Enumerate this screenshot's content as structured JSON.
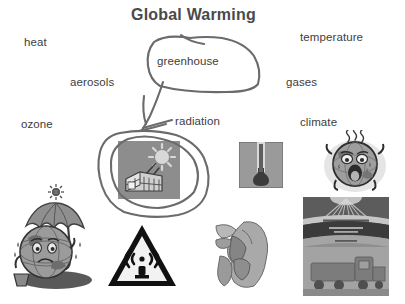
{
  "page": {
    "title": "Global Warming",
    "title_pos": {
      "x": 131,
      "y": 6
    },
    "background_color": "#ffffff",
    "ink_color": "#6b6b6b",
    "text_color": "#3d3d3d"
  },
  "word_labels": [
    {
      "id": "heat",
      "text": "heat",
      "x": 24,
      "y": 36
    },
    {
      "id": "temperature",
      "text": "temperature",
      "x": 300,
      "y": 31
    },
    {
      "id": "aerosols",
      "text": "aerosols",
      "x": 70,
      "y": 76
    },
    {
      "id": "gases",
      "text": "gases",
      "x": 286,
      "y": 76
    },
    {
      "id": "greenhouse",
      "text": "greenhouse",
      "x": 157,
      "y": 55,
      "circled": true
    },
    {
      "id": "ozone",
      "text": "ozone",
      "x": 21,
      "y": 118
    },
    {
      "id": "radiation",
      "text": "radiation",
      "x": 175,
      "y": 115
    },
    {
      "id": "climate",
      "text": "climate",
      "x": 300,
      "y": 116
    }
  ],
  "annotations": [
    {
      "id": "greenhouse-circle",
      "type": "hand-drawn-oval",
      "target": "greenhouse",
      "stroke": "#6b6b6b"
    },
    {
      "id": "greenhouse-to-image-arrow",
      "type": "hand-drawn-arrow",
      "from": "greenhouse-word",
      "to": "greenhouse-picture",
      "stroke": "#6b6b6b"
    },
    {
      "id": "greenhouse-picture-circle",
      "type": "hand-drawn-oval",
      "target": "greenhouse-picture",
      "stroke": "#6b6b6b"
    }
  ],
  "pictures": [
    {
      "id": "greenhouse-picture",
      "name": "greenhouse-sun-illustration",
      "caption": "greenhouse with sun and radiation rays",
      "x": 118,
      "y": 141,
      "w": 62,
      "h": 58,
      "fill": "#8d8d8d"
    },
    {
      "id": "earth-umbrella-picture",
      "name": "earth-with-umbrella-illustration",
      "caption": "sweating cartoon earth sheltering under an umbrella",
      "x": 12,
      "y": 182,
      "w": 86,
      "h": 108
    },
    {
      "id": "radiation-sign-picture",
      "name": "radiation-warning-sign",
      "caption": "black triangle warning sign with radio wave symbol",
      "x": 105,
      "y": 222,
      "w": 74,
      "h": 68
    },
    {
      "id": "thermometer-picture",
      "name": "thermometer-icon",
      "caption": "thermometer in a grey square",
      "x": 239,
      "y": 142,
      "w": 44,
      "h": 46,
      "fill": "#9a9a9a"
    },
    {
      "id": "hand-picture",
      "name": "grey-hand-illustration",
      "caption": "grey abstract hand shape",
      "x": 214,
      "y": 216,
      "w": 58,
      "h": 74
    },
    {
      "id": "angry-earth-picture",
      "name": "overheated-earth-illustration",
      "caption": "overheated cartoon earth with heat waves",
      "x": 322,
      "y": 130,
      "w": 66,
      "h": 62
    },
    {
      "id": "poster-picture",
      "name": "climate-poster-illustration",
      "caption": "grey climate poster with sun rays and vehicles",
      "x": 303,
      "y": 197,
      "w": 86,
      "h": 99,
      "fill": "#9e9e9e"
    }
  ]
}
